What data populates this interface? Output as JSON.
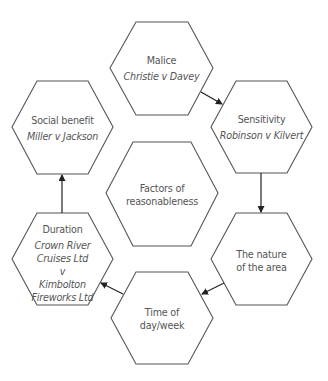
{
  "diagram": {
    "center": {
      "title": "Factors of reasonableness"
    },
    "nodes": [
      {
        "id": "malice",
        "title": "Malice",
        "case": "Christie v Davey"
      },
      {
        "id": "sensitivity",
        "title": "Sensitivity",
        "case": "Robinson v Kilvert"
      },
      {
        "id": "nature",
        "title": "The nature of the area",
        "case": ""
      },
      {
        "id": "time",
        "title": "Time of day/week",
        "case": ""
      },
      {
        "id": "duration",
        "title": "Duration",
        "case": "Crown River Cruises Ltd v Kimbolton Fireworks Ltd"
      },
      {
        "id": "social",
        "title": "Social benefit",
        "case": "Miller v Jackson"
      }
    ],
    "flow": [
      "malice",
      "sensitivity",
      "nature",
      "time",
      "duration",
      "social"
    ],
    "colors": {
      "stroke": "#444444",
      "text": "#555555",
      "background": "#ffffff"
    }
  },
  "labels": {
    "center_l1": "Factors of",
    "center_l2": "reasonableness",
    "malice_title": "Malice",
    "malice_case": "Christie v Davey",
    "sensitivity_title": "Sensitivity",
    "sensitivity_case": "Robinson v Kilvert",
    "nature_l1": "The nature",
    "nature_l2": "of the area",
    "time_l1": "Time of",
    "time_l2": "day/week",
    "duration_title": "Duration",
    "duration_case_l1": "Crown River",
    "duration_case_l2": "Cruises Ltd",
    "duration_case_l3": "v",
    "duration_case_l4": "Kimbolton",
    "duration_case_l5": "Fireworks Ltd",
    "social_title": "Social benefit",
    "social_case": "Miller v Jackson"
  }
}
